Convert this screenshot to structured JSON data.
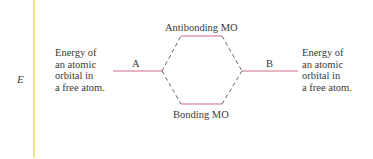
{
  "diagram": {
    "type": "molecular-orbital-energy-diagram",
    "axis": {
      "label": "E",
      "color": "#f2d45c"
    },
    "left_orbital": {
      "label": "A",
      "description": [
        "Energy of",
        "an atomic",
        "orbital in",
        "a free atom."
      ]
    },
    "right_orbital": {
      "label": "B",
      "description": [
        "Energy of",
        "an atomic",
        "orbital in",
        "a free atom."
      ]
    },
    "antibonding": {
      "label": "Antibonding MO"
    },
    "bonding": {
      "label": "Bonding MO"
    },
    "colors": {
      "level_line": "#d46a86",
      "dashed_line": "#555555",
      "text": "#3a3a3a"
    }
  }
}
